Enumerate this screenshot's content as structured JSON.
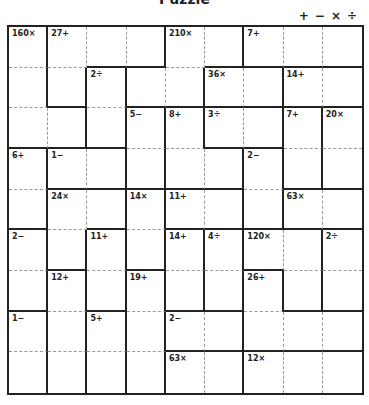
{
  "title": "Puzzle",
  "operators": [
    "+",
    "−",
    "×",
    "÷"
  ],
  "grid": {
    "size": 9,
    "cages_map": [
      [
        "A",
        "B",
        "B",
        "B",
        "D",
        "D",
        "E",
        "E",
        "E"
      ],
      [
        "A",
        "B",
        "C",
        "D",
        "D",
        "F",
        "F",
        "G",
        "G"
      ],
      [
        "A",
        "A",
        "C",
        "H",
        "I",
        "J",
        "J",
        "K",
        "L"
      ],
      [
        "M",
        "N",
        "N",
        "H",
        "I",
        "I",
        "O",
        "K",
        "L"
      ],
      [
        "M",
        "P",
        "P",
        "Q",
        "R",
        "R",
        "O",
        "S",
        "S"
      ],
      [
        "T",
        "P",
        "U",
        "Q",
        "V",
        "W",
        "X",
        "X",
        "Y"
      ],
      [
        "T",
        "Z",
        "U",
        "AA",
        "V",
        "W",
        "BB",
        "X",
        "Y"
      ],
      [
        "CC",
        "Z",
        "DD",
        "AA",
        "EE",
        "EE",
        "BB",
        "BB",
        "BB"
      ],
      [
        "CC",
        "Z",
        "DD",
        "AA",
        "FF",
        "FF",
        "GG",
        "GG",
        "GG"
      ]
    ],
    "clues": [
      {
        "row": 0,
        "col": 0,
        "label": "160×"
      },
      {
        "row": 0,
        "col": 1,
        "label": "27+"
      },
      {
        "row": 0,
        "col": 4,
        "label": "210×"
      },
      {
        "row": 0,
        "col": 6,
        "label": "7+"
      },
      {
        "row": 1,
        "col": 2,
        "label": "2÷"
      },
      {
        "row": 1,
        "col": 5,
        "label": "36×"
      },
      {
        "row": 1,
        "col": 7,
        "label": "14+"
      },
      {
        "row": 2,
        "col": 3,
        "label": "5−"
      },
      {
        "row": 2,
        "col": 4,
        "label": "8+"
      },
      {
        "row": 2,
        "col": 5,
        "label": "3÷"
      },
      {
        "row": 2,
        "col": 7,
        "label": "7+"
      },
      {
        "row": 2,
        "col": 8,
        "label": "20×"
      },
      {
        "row": 3,
        "col": 0,
        "label": "6+"
      },
      {
        "row": 3,
        "col": 1,
        "label": "1−"
      },
      {
        "row": 3,
        "col": 6,
        "label": "2−"
      },
      {
        "row": 4,
        "col": 1,
        "label": "24×"
      },
      {
        "row": 4,
        "col": 3,
        "label": "14×"
      },
      {
        "row": 4,
        "col": 4,
        "label": "11+"
      },
      {
        "row": 4,
        "col": 7,
        "label": "63×"
      },
      {
        "row": 5,
        "col": 0,
        "label": "2−"
      },
      {
        "row": 5,
        "col": 2,
        "label": "11+"
      },
      {
        "row": 5,
        "col": 4,
        "label": "14+"
      },
      {
        "row": 5,
        "col": 5,
        "label": "4÷"
      },
      {
        "row": 5,
        "col": 6,
        "label": "120×"
      },
      {
        "row": 5,
        "col": 8,
        "label": "2÷"
      },
      {
        "row": 6,
        "col": 1,
        "label": "12+"
      },
      {
        "row": 6,
        "col": 3,
        "label": "19+"
      },
      {
        "row": 6,
        "col": 6,
        "label": "26+"
      },
      {
        "row": 7,
        "col": 0,
        "label": "1−"
      },
      {
        "row": 7,
        "col": 2,
        "label": "5+"
      },
      {
        "row": 7,
        "col": 4,
        "label": "2−"
      },
      {
        "row": 8,
        "col": 4,
        "label": "63×"
      },
      {
        "row": 8,
        "col": 6,
        "label": "12×"
      }
    ]
  },
  "colors": {
    "line": "#222222",
    "dash": "#999999",
    "background": "#ffffff"
  }
}
